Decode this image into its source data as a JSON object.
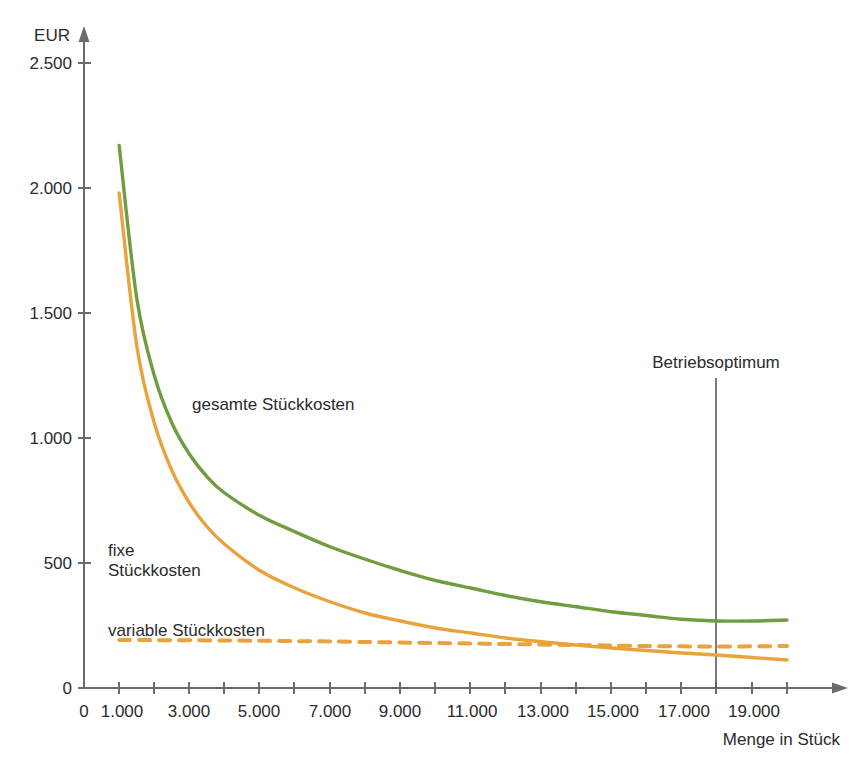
{
  "chart_data": {
    "type": "line",
    "title": "",
    "xlabel": "Menge in Stück",
    "ylabel": "EUR",
    "xlim": [
      0,
      20500
    ],
    "ylim": [
      0,
      2500
    ],
    "grid": false,
    "legend_position": "inline-labels",
    "x_ticks": [
      0,
      1000,
      2000,
      3000,
      4000,
      5000,
      6000,
      7000,
      8000,
      9000,
      10000,
      11000,
      12000,
      13000,
      14000,
      15000,
      16000,
      17000,
      18000,
      19000,
      20000
    ],
    "x_tick_labels": [
      "0",
      "1.000",
      "",
      "3.000",
      "",
      "5.000",
      "",
      "7.000",
      "",
      "9.000",
      "",
      "11.000",
      "",
      "13.000",
      "",
      "15.000",
      "",
      "17.000",
      "",
      "19.000",
      ""
    ],
    "y_ticks": [
      0,
      500,
      1000,
      1500,
      2000,
      2500
    ],
    "y_tick_labels": [
      "0",
      "500",
      "1.000",
      "1.500",
      "2.000",
      "2.500"
    ],
    "series": [
      {
        "name": "gesamte Stückkosten",
        "label": "gesamte Stückkosten",
        "color": "#6f9d3f",
        "style": "solid",
        "x": [
          1000,
          1500,
          2000,
          2500,
          3000,
          3500,
          4000,
          5000,
          6000,
          7000,
          8000,
          9000,
          10000,
          11000,
          12000,
          13000,
          14000,
          15000,
          16000,
          17000,
          18000,
          19000,
          20000
        ],
        "y": [
          2170,
          1560,
          1250,
          1060,
          935,
          845,
          780,
          690,
          625,
          565,
          515,
          470,
          430,
          400,
          370,
          345,
          325,
          305,
          290,
          275,
          268,
          268,
          272
        ]
      },
      {
        "name": "fixe Stückkosten",
        "label": "fixe Stückkosten",
        "color": "#e8a33d",
        "style": "solid",
        "x": [
          1000,
          1500,
          2000,
          2500,
          3000,
          3500,
          4000,
          5000,
          6000,
          7000,
          8000,
          9000,
          10000,
          11000,
          12000,
          13000,
          14000,
          15000,
          16000,
          17000,
          18000,
          19000,
          20000
        ],
        "y": [
          1980,
          1370,
          1060,
          870,
          740,
          645,
          575,
          470,
          400,
          345,
          300,
          268,
          240,
          220,
          200,
          185,
          172,
          160,
          150,
          140,
          132,
          122,
          112
        ]
      },
      {
        "name": "variable Stückkosten",
        "label": "variable Stückkosten",
        "color": "#e8a33d",
        "style": "dashed",
        "x": [
          1000,
          4000,
          7000,
          10000,
          12000,
          14000,
          16000,
          18000,
          20000
        ],
        "y": [
          192,
          190,
          186,
          180,
          176,
          172,
          168,
          166,
          168
        ]
      }
    ],
    "annotations": [
      {
        "name": "betriebsoptimum",
        "label": "Betriebsoptimum",
        "x": 18000,
        "y_top": 2500,
        "y_bottom": 0
      }
    ],
    "series_label_positions": [
      {
        "key": "gesamte",
        "x_px": 192,
        "y_px": 404
      },
      {
        "key": "fixe_line1",
        "x_px": 108,
        "y_px": 551
      },
      {
        "key": "fixe_line2",
        "x_px": 108,
        "y_px": 570
      },
      {
        "key": "variable",
        "x_px": 108,
        "y_px": 630
      }
    ]
  },
  "axes": {
    "y_axis_title": "EUR",
    "x_axis_title": "Menge in Stück",
    "origin_label": "0"
  },
  "labels": {
    "gesamte": "gesamte Stückkosten",
    "fixe_line1": "fixe",
    "fixe_line2": "Stückkosten",
    "variable": "variable Stückkosten",
    "betriebsoptimum": "Betriebsoptimum"
  },
  "y_tick_text": {
    "t0": "0",
    "t500": "500",
    "t1000": "1.000",
    "t1500": "1.500",
    "t2000": "2.000",
    "t2500": "2.500"
  },
  "x_tick_text": {
    "t0": "0",
    "t1000": "1.000",
    "t3000": "3.000",
    "t5000": "5.000",
    "t7000": "7.000",
    "t9000": "9.000",
    "t11000": "11.000",
    "t13000": "13.000",
    "t15000": "15.000",
    "t17000": "17.000",
    "t19000": "19.000"
  },
  "colors": {
    "total_cost": "#6f9d3f",
    "fixed_cost": "#e8a33d",
    "variable_cost": "#e8a33d",
    "axis": "#6b6b6b",
    "text": "#2b2b2b",
    "background": "#ffffff"
  }
}
